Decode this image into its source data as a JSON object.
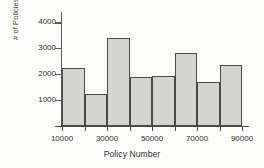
{
  "chart_data": {
    "type": "bar",
    "title": "",
    "xlabel": "Policy Number",
    "ylabel": "# of Policies",
    "grid": false,
    "legend": false,
    "xlim": [
      10000,
      90000
    ],
    "ylim": [
      0,
      4400
    ],
    "bin_width": 10000,
    "bin_edges": [
      10000,
      20000,
      30000,
      40000,
      50000,
      60000,
      70000,
      80000,
      90000
    ],
    "categories": [
      "10000-20000",
      "20000-30000",
      "30000-40000",
      "40000-50000",
      "50000-60000",
      "60000-70000",
      "70000-80000",
      "80000-90000"
    ],
    "values": [
      2250,
      1250,
      3400,
      1900,
      1920,
      2830,
      1680,
      2370
    ],
    "y_ticks": [
      1000,
      2000,
      3000,
      4000
    ],
    "y_tick_labels": [
      "1000",
      "2000",
      "3000",
      "4000"
    ],
    "x_ticks": [
      10000,
      30000,
      50000,
      70000,
      90000
    ],
    "x_tick_labels": [
      "10000",
      "30000",
      "50000",
      "70000",
      "90000"
    ],
    "colors": {
      "bar_fill": "#d4d4d2",
      "bar_edge": "#4a4a4a",
      "axis": "#4a4a4a",
      "text": "#2e2e2e",
      "background": "#fdfdfc"
    }
  }
}
